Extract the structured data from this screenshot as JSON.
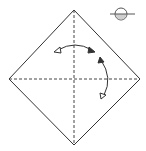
{
  "diagram": {
    "type": "origami-fold-diagram",
    "title": "",
    "colors": {
      "line": "#333333",
      "shade": "#cfcfcf",
      "background": "#ffffff"
    },
    "symbols": [
      "turn-over-icon",
      "fold-unfold-arrow-horizontal",
      "fold-unfold-arrow-vertical"
    ],
    "creases": [
      "horizontal-valley-fold",
      "vertical-valley-fold"
    ]
  }
}
